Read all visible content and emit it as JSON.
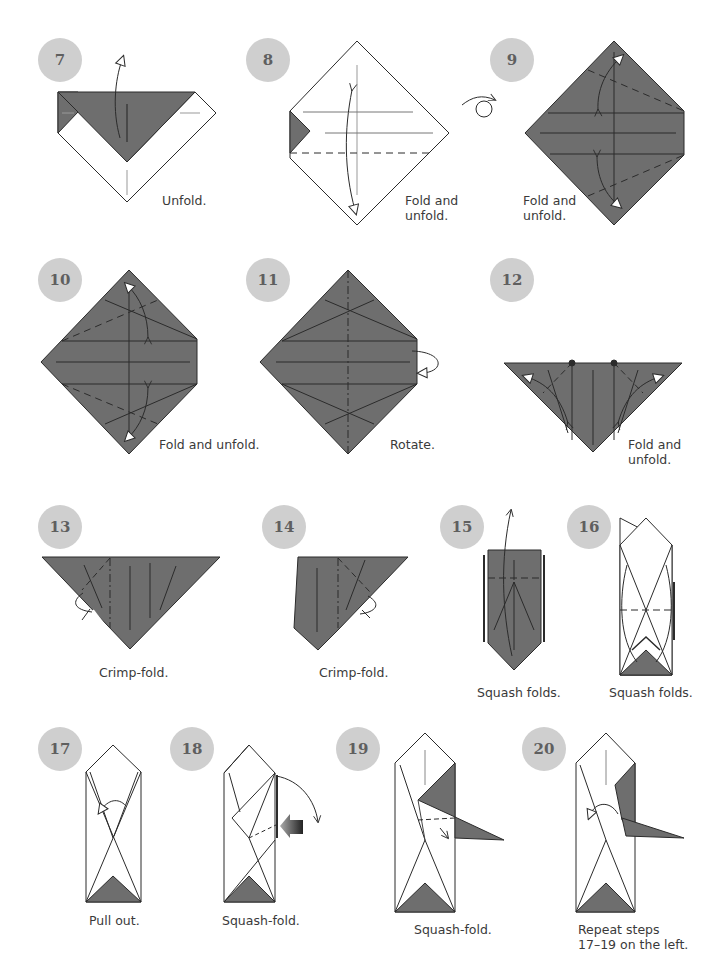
{
  "colors": {
    "paper_color": "#6e6e6e",
    "paper_white": "#ffffff",
    "line": "#2b2b2b",
    "badge_bg": "#cfcfcf",
    "badge_text": "#5f5f5f"
  },
  "steps": [
    {
      "number": "7",
      "caption": "Unfold."
    },
    {
      "number": "8",
      "caption": "Fold and\nunfold."
    },
    {
      "number": "9",
      "caption": "Fold and\nunfold."
    },
    {
      "number": "10",
      "caption": "Fold and unfold."
    },
    {
      "number": "11",
      "caption": "Rotate."
    },
    {
      "number": "12",
      "caption": "Fold and\nunfold."
    },
    {
      "number": "13",
      "caption": "Crimp-fold."
    },
    {
      "number": "14",
      "caption": "Crimp-fold."
    },
    {
      "number": "15",
      "caption": "Squash folds."
    },
    {
      "number": "16",
      "caption": "Squash folds."
    },
    {
      "number": "17",
      "caption": "Pull out."
    },
    {
      "number": "18",
      "caption": "Squash-fold."
    },
    {
      "number": "19",
      "caption": "Squash-fold."
    },
    {
      "number": "20",
      "caption": "Repeat steps\n17–19 on the left."
    }
  ],
  "symbols": {
    "turn_over": "turn-over-icon",
    "rotate": "rotate-icon",
    "push": "push-arrow-icon"
  }
}
